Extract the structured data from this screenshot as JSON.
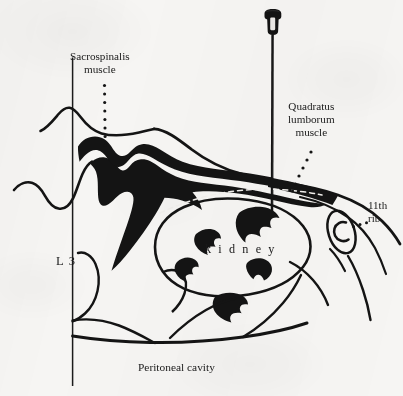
{
  "figure": {
    "background_color": "#f6f5f3",
    "ink_color": "#141414",
    "labels": {
      "sacrospinalis": {
        "line1": "Sacrospinalis",
        "line2": "muscle"
      },
      "quadratus": {
        "line1": "Quadratus",
        "line2": "lumborum",
        "line3": "muscle"
      },
      "rib": {
        "line1": "11th",
        "line2": "rib"
      },
      "kidney": "k i d n e y",
      "vertebra": "L 3",
      "peritoneal": "Peritoneal cavity"
    },
    "parts": {
      "needle_hub": "needle-hub",
      "needle_shaft": "needle-shaft",
      "sacrospinalis_mass": "sacrospinalis-muscle-mass",
      "kidney_outline": "kidney-outline",
      "kidney_calyces_count": 5,
      "rib_section": "eleventh-rib-cross-section",
      "midline": "L3-vertical-reference-line",
      "skin_contour": "skin-and-flank-contour",
      "fascia_dashes": "renal-fascia-dashed-line"
    },
    "leaders": {
      "sacrospinalis_leader": "dotted-vertical",
      "quadratus_leader": "dotted-diagonal",
      "rib_leader": "dotted-short"
    }
  }
}
